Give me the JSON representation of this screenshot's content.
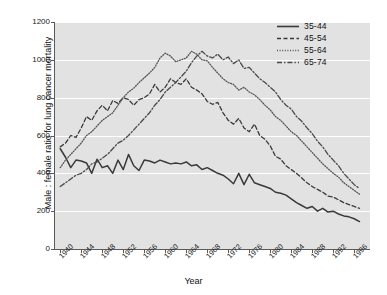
{
  "chart_data": {
    "type": "line",
    "title": "",
    "xlabel": "Year",
    "ylabel": "Male : female ratio for lung cancer mortality",
    "xlim": [
      1939,
      1999
    ],
    "ylim": [
      0,
      1200
    ],
    "grid": true,
    "legend_position": "top-right",
    "ytick_labels": [
      "1200",
      "1000",
      "800",
      "600",
      "400",
      "200",
      "0"
    ],
    "ytick_values": [
      1200,
      1000,
      800,
      600,
      400,
      200,
      0
    ],
    "xtick_labels": [
      "1940",
      "1944",
      "1948",
      "1952",
      "1956",
      "1960",
      "1964",
      "1968",
      "1972",
      "1976",
      "1980",
      "1984",
      "1988",
      "1992",
      "1996"
    ],
    "xtick_values": [
      1940,
      1944,
      1948,
      1952,
      1956,
      1960,
      1964,
      1968,
      1972,
      1976,
      1980,
      1984,
      1988,
      1992,
      1996
    ],
    "x": [
      1940,
      1941,
      1942,
      1943,
      1944,
      1945,
      1946,
      1947,
      1948,
      1949,
      1950,
      1951,
      1952,
      1953,
      1954,
      1955,
      1956,
      1957,
      1958,
      1959,
      1960,
      1961,
      1962,
      1963,
      1964,
      1965,
      1966,
      1967,
      1968,
      1969,
      1970,
      1971,
      1972,
      1973,
      1974,
      1975,
      1976,
      1977,
      1978,
      1979,
      1980,
      1981,
      1982,
      1983,
      1984,
      1985,
      1986,
      1987,
      1988,
      1989,
      1990,
      1991,
      1992,
      1993,
      1994,
      1995,
      1996,
      1997
    ],
    "series": [
      {
        "name": "35-44",
        "style": "solid",
        "color": "#3a3a3a",
        "values": [
          530,
          485,
          430,
          470,
          465,
          455,
          400,
          475,
          430,
          440,
          400,
          470,
          420,
          500,
          440,
          415,
          470,
          465,
          455,
          470,
          460,
          450,
          455,
          450,
          460,
          440,
          445,
          420,
          430,
          415,
          400,
          390,
          370,
          345,
          400,
          340,
          395,
          350,
          340,
          330,
          320,
          300,
          295,
          285,
          265,
          245,
          230,
          215,
          225,
          200,
          215,
          195,
          200,
          185,
          175,
          170,
          160,
          145
        ]
      },
      {
        "name": "45-54",
        "style": "dashed",
        "color": "#3a3a3a",
        "values": [
          540,
          560,
          600,
          590,
          640,
          700,
          680,
          730,
          760,
          730,
          785,
          770,
          800,
          790,
          760,
          790,
          800,
          820,
          870,
          830,
          855,
          900,
          880,
          870,
          900,
          855,
          840,
          820,
          780,
          765,
          775,
          720,
          680,
          660,
          690,
          640,
          620,
          660,
          600,
          580,
          545,
          490,
          475,
          440,
          420,
          400,
          375,
          350,
          330,
          315,
          300,
          280,
          275,
          260,
          245,
          235,
          225,
          215
        ]
      },
      {
        "name": "55-64",
        "style": "dotted",
        "color": "#555555",
        "values": [
          430,
          470,
          500,
          530,
          560,
          600,
          620,
          650,
          680,
          700,
          720,
          760,
          800,
          830,
          850,
          880,
          905,
          930,
          960,
          1010,
          1035,
          1020,
          990,
          1000,
          1010,
          1045,
          1030,
          1000,
          995,
          960,
          930,
          900,
          880,
          870,
          840,
          855,
          830,
          815,
          790,
          760,
          735,
          700,
          680,
          650,
          620,
          600,
          570,
          540,
          510,
          480,
          450,
          425,
          400,
          380,
          350,
          330,
          310,
          290
        ]
      },
      {
        "name": "65-74",
        "style": "dashdot",
        "color": "#4a4a4a",
        "values": [
          330,
          350,
          370,
          390,
          400,
          420,
          450,
          460,
          480,
          500,
          530,
          560,
          575,
          600,
          630,
          660,
          690,
          720,
          760,
          790,
          830,
          855,
          880,
          910,
          940,
          985,
          1020,
          1045,
          1020,
          1010,
          1030,
          1000,
          1015,
          980,
          1000,
          955,
          960,
          930,
          900,
          880,
          855,
          830,
          790,
          760,
          740,
          700,
          675,
          640,
          610,
          570,
          540,
          500,
          470,
          440,
          400,
          370,
          340,
          320
        ]
      }
    ]
  },
  "legend": {
    "items": [
      {
        "label": "35-44",
        "style": "solid"
      },
      {
        "label": "45-54",
        "style": "dashed"
      },
      {
        "label": "55-64",
        "style": "dotted"
      },
      {
        "label": "65-74",
        "style": "dashdot"
      }
    ]
  }
}
